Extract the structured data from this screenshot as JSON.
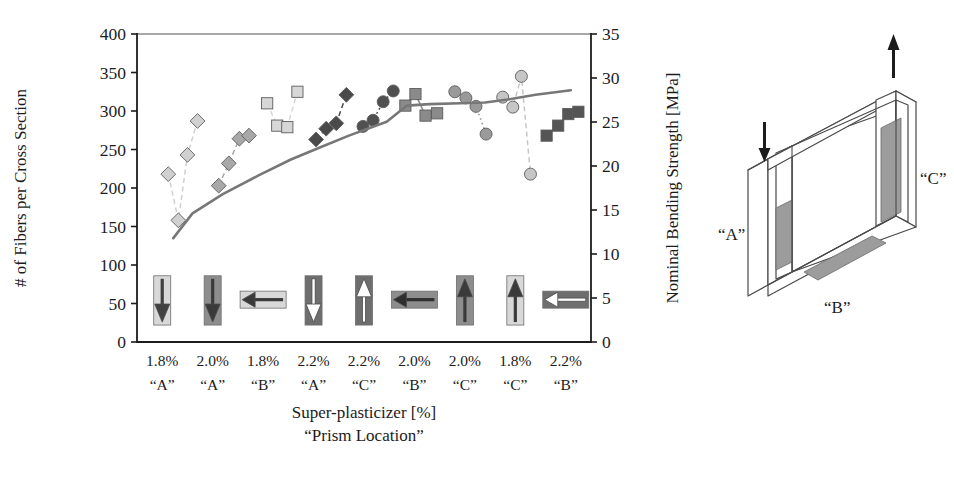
{
  "chart_data": {
    "type": "scatter",
    "title": "",
    "xlabel": "Super-plasticizer [%]",
    "xlabel2": "“Prism Location”",
    "ylabel": "# of Fibers per Cross Section",
    "ylabel_right": "Nominal Bending Strength [MPa]",
    "ylim": [
      0,
      400
    ],
    "yticks": [
      0,
      50,
      100,
      150,
      200,
      250,
      300,
      350,
      400
    ],
    "ylim_right": [
      0,
      35
    ],
    "yticks_right": [
      0,
      5,
      10,
      15,
      20,
      25,
      30,
      35
    ],
    "grid": false,
    "legend_position": "none",
    "categories": [
      {
        "sp": "1.8%",
        "loc": "“A”"
      },
      {
        "sp": "2.0%",
        "loc": "“A”"
      },
      {
        "sp": "1.8%",
        "loc": "“B”"
      },
      {
        "sp": "2.2%",
        "loc": "“A”"
      },
      {
        "sp": "2.2%",
        "loc": "“C”"
      },
      {
        "sp": "2.0%",
        "loc": "“B”"
      },
      {
        "sp": "2.0%",
        "loc": "“C”"
      },
      {
        "sp": "1.8%",
        "loc": "“C”"
      },
      {
        "sp": "2.2%",
        "loc": "“B”"
      }
    ],
    "series": [
      {
        "name": "group-1",
        "marker": "diamond",
        "color": "#d0d0d0",
        "line": "dashed",
        "points": [
          [
            0.62,
            218
          ],
          [
            0.82,
            158
          ],
          [
            1.0,
            243
          ],
          [
            1.2,
            287
          ]
        ]
      },
      {
        "name": "group-2",
        "marker": "diamond",
        "color": "#a8a8a8",
        "line": "dashed",
        "points": [
          [
            1.62,
            203
          ],
          [
            1.82,
            232
          ],
          [
            2.03,
            264
          ],
          [
            2.22,
            268
          ]
        ]
      },
      {
        "name": "group-3",
        "marker": "square",
        "color": "#d7d7d7",
        "line": "dashed",
        "points": [
          [
            2.58,
            310
          ],
          [
            2.78,
            281
          ],
          [
            2.98,
            279
          ],
          [
            3.18,
            325
          ]
        ]
      },
      {
        "name": "group-4",
        "marker": "diamond",
        "color": "#4a4a4a",
        "line": "dashed",
        "points": [
          [
            3.55,
            263
          ],
          [
            3.75,
            277
          ],
          [
            3.95,
            284
          ],
          [
            4.15,
            321
          ]
        ]
      },
      {
        "name": "group-5",
        "marker": "circle",
        "color": "#505050",
        "line": "dotted",
        "points": [
          [
            4.48,
            280
          ],
          [
            4.68,
            288
          ],
          [
            4.88,
            312
          ],
          [
            5.08,
            326
          ]
        ]
      },
      {
        "name": "group-6",
        "marker": "square",
        "color": "#8a8a8a",
        "line": "solid",
        "points": [
          [
            5.32,
            307
          ],
          [
            5.52,
            322
          ],
          [
            5.72,
            294
          ],
          [
            5.95,
            297
          ]
        ]
      },
      {
        "name": "group-7",
        "marker": "circle",
        "color": "#9a9a9a",
        "line": "dotted",
        "points": [
          [
            6.3,
            325
          ],
          [
            6.52,
            317
          ],
          [
            6.72,
            306
          ],
          [
            6.92,
            270
          ]
        ]
      },
      {
        "name": "group-8",
        "marker": "circle",
        "color": "#c6c6c6",
        "line": "dashed",
        "points": [
          [
            7.25,
            318
          ],
          [
            7.45,
            305
          ],
          [
            7.62,
            345
          ],
          [
            7.8,
            218
          ]
        ]
      },
      {
        "name": "group-9",
        "marker": "square",
        "color": "#555555",
        "line": "solid",
        "points": [
          [
            8.12,
            268
          ],
          [
            8.35,
            281
          ],
          [
            8.55,
            296
          ],
          [
            8.75,
            299
          ]
        ]
      }
    ],
    "trend_line": {
      "name": "nominal-bending-strength",
      "color": "#777777",
      "points": [
        [
          0.72,
          135
        ],
        [
          1.1,
          167
        ],
        [
          1.7,
          192
        ],
        [
          2.4,
          216
        ],
        [
          3.05,
          237
        ],
        [
          3.6,
          252
        ],
        [
          4.2,
          268
        ],
        [
          4.95,
          286
        ],
        [
          5.35,
          307
        ],
        [
          5.8,
          309
        ],
        [
          6.4,
          310
        ],
        [
          6.9,
          311
        ],
        [
          7.35,
          315
        ],
        [
          7.9,
          321
        ],
        [
          8.6,
          327
        ]
      ]
    },
    "arrow_icons": [
      {
        "name": "arrow-down-light",
        "direction": "down",
        "body_color": "#d8d8d8",
        "head_color": "#404040",
        "position": 0
      },
      {
        "name": "arrow-down-dark",
        "direction": "down",
        "body_color": "#8d8d8d",
        "head_color": "#3a3a3a",
        "position": 1
      },
      {
        "name": "arrow-left-light",
        "direction": "left",
        "body_color": "#d8d8d8",
        "head_color": "#3a3a3a",
        "position": 2
      },
      {
        "name": "arrow-down-outline",
        "direction": "down",
        "body_color": "#6e6e6e",
        "head_color": "#ffffff",
        "position": 3
      },
      {
        "name": "arrow-up-outline",
        "direction": "up",
        "body_color": "#6e6e6e",
        "head_color": "#ffffff",
        "position": 4
      },
      {
        "name": "arrow-left-dark",
        "direction": "left",
        "body_color": "#8d8d8d",
        "head_color": "#2f2f2f",
        "position": 5
      },
      {
        "name": "arrow-up-dark",
        "direction": "up",
        "body_color": "#8d8d8d",
        "head_color": "#3a3a3a",
        "position": 6
      },
      {
        "name": "arrow-up-light",
        "direction": "up",
        "body_color": "#d8d8d8",
        "head_color": "#3a3a3a",
        "position": 7
      },
      {
        "name": "arrow-left-outline",
        "direction": "left",
        "body_color": "#6e6e6e",
        "head_color": "#ffffff",
        "position": 8
      }
    ]
  },
  "prism": {
    "labels": {
      "a": "“A”",
      "b": "“B”",
      "c": "“C”"
    },
    "arrows": {
      "left": "arrow-down",
      "right": "arrow-up"
    },
    "colors": {
      "outline": "#4a4a4a",
      "shade": "#9c9c9c",
      "face": "#ffffff"
    }
  },
  "colors": {
    "axis": "#1c1c1c",
    "trend": "#777777",
    "background": "#ffffff"
  }
}
